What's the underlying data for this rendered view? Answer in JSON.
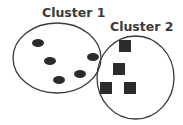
{
  "diagram": {
    "clusters": [
      {
        "label": "Cluster 1",
        "shape": "ellipse",
        "member_shape": "oval",
        "member_count": 5
      },
      {
        "label": "Cluster 2",
        "shape": "ellipse",
        "member_shape": "square",
        "member_count": 4
      }
    ],
    "colors": {
      "stroke": "#3a3a3a",
      "fill": "#2b2b2b",
      "background": "#ffffff"
    }
  }
}
